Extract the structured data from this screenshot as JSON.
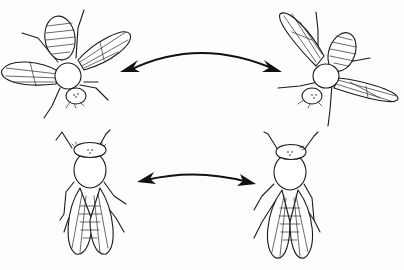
{
  "figure": {
    "colors": {
      "ink": "#1a1a1a",
      "background": "#fdfdfd"
    },
    "panels": [
      {
        "id": "top-left-fly",
        "pose": "wings spread, viewed from above, head pointing down-right"
      },
      {
        "id": "top-right-fly",
        "pose": "wings spread, viewed from above, head pointing down-left"
      },
      {
        "id": "bottom-left-fly",
        "pose": "wings folded, dorsal view, head up"
      },
      {
        "id": "bottom-right-fly",
        "pose": "wings folded, dorsal view, head up"
      }
    ],
    "arrows": [
      {
        "id": "top-arrow",
        "type": "double-headed curved",
        "from": "top-left-fly",
        "to": "top-right-fly"
      },
      {
        "id": "bottom-arrow",
        "type": "double-headed curved",
        "from": "bottom-left-fly",
        "to": "bottom-right-fly"
      }
    ]
  }
}
